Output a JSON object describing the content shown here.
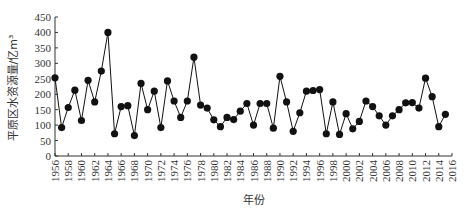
{
  "chart_data": {
    "type": "line",
    "title": "",
    "xlabel": "年份",
    "ylabel": "平原区水资源量/亿m³",
    "ylim": [
      0,
      450
    ],
    "xlim": [
      1956,
      2016
    ],
    "yticks": [
      0,
      50,
      100,
      150,
      200,
      250,
      300,
      350,
      400,
      450
    ],
    "xticks": [
      1956,
      1958,
      1960,
      1962,
      1964,
      1966,
      1968,
      1970,
      1972,
      1974,
      1976,
      1978,
      1980,
      1982,
      1984,
      1986,
      1988,
      1990,
      1992,
      1994,
      1996,
      1998,
      2000,
      2002,
      2004,
      2006,
      2008,
      2010,
      2012,
      2014,
      2016
    ],
    "grid": false,
    "legend": null,
    "marker": "filled-circle",
    "series": [
      {
        "name": "平原区水资源量",
        "color": "#111111",
        "x": [
          1956,
          1957,
          1958,
          1959,
          1960,
          1961,
          1962,
          1963,
          1964,
          1965,
          1966,
          1967,
          1968,
          1969,
          1970,
          1971,
          1972,
          1973,
          1974,
          1975,
          1976,
          1977,
          1978,
          1979,
          1980,
          1981,
          1982,
          1983,
          1984,
          1985,
          1986,
          1987,
          1988,
          1989,
          1990,
          1991,
          1992,
          1993,
          1994,
          1995,
          1996,
          1997,
          1998,
          1999,
          2000,
          2001,
          2002,
          2003,
          2004,
          2005,
          2006,
          2007,
          2008,
          2009,
          2010,
          2011,
          2012,
          2013,
          2014,
          2015
        ],
        "values": [
          253,
          92,
          157,
          213,
          115,
          245,
          175,
          275,
          400,
          72,
          160,
          163,
          66,
          235,
          150,
          210,
          92,
          243,
          178,
          125,
          178,
          320,
          165,
          155,
          117,
          95,
          125,
          118,
          145,
          170,
          100,
          170,
          170,
          90,
          258,
          175,
          80,
          140,
          210,
          212,
          215,
          72,
          175,
          70,
          137,
          88,
          112,
          178,
          160,
          130,
          100,
          130,
          150,
          172,
          173,
          155,
          252,
          192,
          95,
          135
        ]
      }
    ]
  }
}
